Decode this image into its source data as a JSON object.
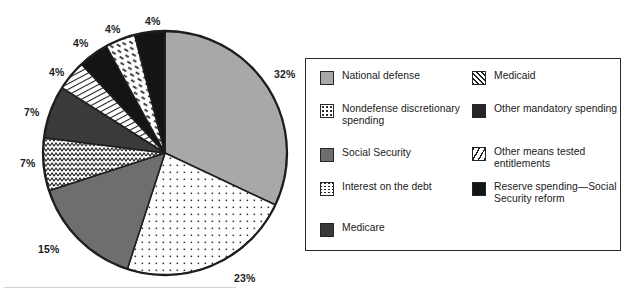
{
  "figure": {
    "name": "federal-spending-pie-chart",
    "background_color": "#ffffff"
  },
  "chart_data": {
    "type": "pie",
    "title": "",
    "subtitle": "",
    "xlabel": "",
    "ylabel": "",
    "legend_position": "right",
    "grid": false,
    "units": "percent",
    "total": 100,
    "start_angle_deg": -90,
    "direction": "clockwise",
    "categories": [
      "National defense",
      "Nondefense discretionary spending",
      "Social Security",
      "Interest on the debt",
      "Medicare",
      "Medicaid",
      "Other mandatory spending",
      "Other means tested entitlements",
      "Reserve spending—Social Security reform"
    ],
    "values": [
      32,
      23,
      15,
      7,
      7,
      4,
      4,
      4,
      4
    ],
    "labels": [
      "32%",
      "23%",
      "15%",
      "7%",
      "7%",
      "4%",
      "4%",
      "4%",
      "4%"
    ],
    "slices": [
      {
        "label": "National defense",
        "value": 32,
        "value_label": "32%",
        "fill": "#a8a8a8",
        "pattern": "solid-light-gray",
        "label_x": 274,
        "label_y": 68
      },
      {
        "label": "Nondefense discretionary spending",
        "value": 23,
        "value_label": "23%",
        "fill": "#ffffff",
        "pattern": "fine-dot-grid",
        "label_x": 234,
        "label_y": 272
      },
      {
        "label": "Social Security",
        "value": 15,
        "value_label": "15%",
        "fill": "#6e6e6e",
        "pattern": "solid-medium-gray",
        "label_x": 38,
        "label_y": 243
      },
      {
        "label": "Interest on the debt",
        "value": 7,
        "value_label": "7%",
        "fill": "#ffffff",
        "pattern": "zigzag-wave",
        "label_x": 20,
        "label_y": 157
      },
      {
        "label": "Medicare",
        "value": 7,
        "value_label": "7%",
        "fill": "#3a3a3a",
        "pattern": "solid-dark-gray",
        "label_x": 24,
        "label_y": 106
      },
      {
        "label": "Medicaid",
        "value": 4,
        "value_label": "4%",
        "fill": "#ffffff",
        "pattern": "diagonal-hatch-lines",
        "label_x": 49,
        "label_y": 66
      },
      {
        "label": "Other mandatory spending",
        "value": 4,
        "value_label": "4%",
        "fill": "#141414",
        "pattern": "solid-black",
        "label_x": 73,
        "label_y": 37
      },
      {
        "label": "Other means tested entitlements",
        "value": 4,
        "value_label": "4%",
        "fill": "#ffffff",
        "pattern": "sparse-dash-diagonal",
        "label_x": 105,
        "label_y": 23
      },
      {
        "label": "Reserve spending—Social Security reform",
        "value": 4,
        "value_label": "4%",
        "fill": "#141414",
        "pattern": "solid-black",
        "label_x": 145,
        "label_y": 15
      }
    ]
  },
  "legend": {
    "columns": [
      {
        "name": "legend-column-left",
        "items": [
          {
            "label": "National defense",
            "pattern": "solid-light-gray",
            "fill": "#a8a8a8"
          },
          {
            "label": "Nondefense discretionary spending",
            "pattern": "fine-dot-grid",
            "fill": "#ffffff"
          },
          {
            "label": "Social Security",
            "pattern": "solid-medium-gray",
            "fill": "#6e6e6e"
          },
          {
            "label": "Interest on the debt",
            "pattern": "zigzag-wave",
            "fill": "#ffffff"
          },
          {
            "label": "Medicare",
            "pattern": "solid-dark-gray",
            "fill": "#3a3a3a"
          }
        ]
      },
      {
        "name": "legend-column-right",
        "items": [
          {
            "label": "Medicaid",
            "pattern": "diagonal-hatch-lines",
            "fill": "#ffffff"
          },
          {
            "label": "Other mandatory spending",
            "pattern": "solid-black",
            "fill": "#262626"
          },
          {
            "label": "Other means tested entitlements",
            "pattern": "sparse-dash-diagonal",
            "fill": "#ffffff"
          },
          {
            "label": "Reserve spending—Social Security reform",
            "pattern": "solid-black",
            "fill": "#141414"
          }
        ]
      }
    ]
  },
  "colors": {
    "light_gray": "#a8a8a8",
    "medium_gray": "#6e6e6e",
    "dark_gray": "#3a3a3a",
    "black": "#141414",
    "white": "#ffffff",
    "outline": "#1e1e1e",
    "legend_border": "#2b2b2b"
  }
}
